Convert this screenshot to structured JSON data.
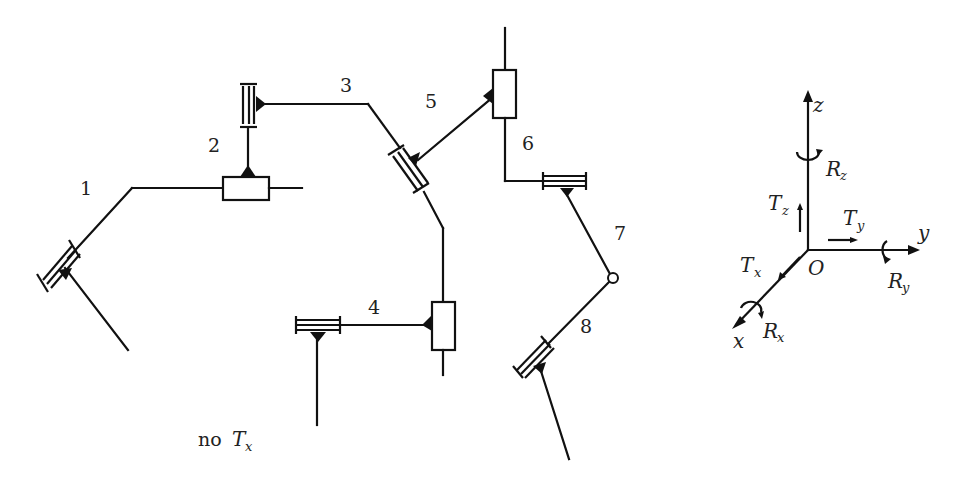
{
  "diagram": {
    "joint_labels": [
      "1",
      "2",
      "3",
      "4",
      "5",
      "6",
      "7",
      "8"
    ],
    "constraint_note": {
      "prefix": "no",
      "symbol": "T",
      "subscript": "x"
    },
    "axes": {
      "origin": "O",
      "x_axis": "x",
      "y_axis": "y",
      "z_axis": "z",
      "translations": [
        {
          "symbol": "T",
          "subscript": "x"
        },
        {
          "symbol": "T",
          "subscript": "y"
        },
        {
          "symbol": "T",
          "subscript": "z"
        }
      ],
      "rotations": [
        {
          "symbol": "R",
          "subscript": "x"
        },
        {
          "symbol": "R",
          "subscript": "y"
        },
        {
          "symbol": "R",
          "subscript": "z"
        }
      ]
    },
    "colors": {
      "stroke": "#111111",
      "background": "#ffffff"
    }
  }
}
